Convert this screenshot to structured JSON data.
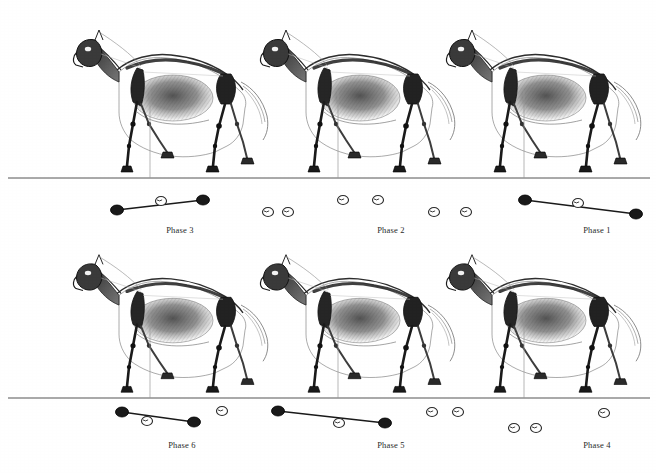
{
  "figure": {
    "width": 656,
    "height": 473,
    "background_color": "#ffffff",
    "ink_color": "#1a1a1a",
    "ground_line_color": "#555555"
  },
  "legend": {
    "filled_marker_meaning": "hoof in contact with ground",
    "open_marker_meaning": "hoof off the ground",
    "connector_meaning": "diagonal limb pair line"
  },
  "rows": [
    {
      "name": "top-row",
      "ground_y": 178,
      "ground_x1": 8,
      "ground_x2": 650,
      "phases": [
        {
          "id": "phase-3",
          "label": "Phase 3",
          "label_x": 180,
          "label_y": 225,
          "horse_x": 75,
          "horse_y": 20,
          "horse_w": 200,
          "horse_h": 160,
          "vertical_ref_x": 150,
          "connector": {
            "x1": 117,
            "y1": 210,
            "x2": 203,
            "y2": 200
          },
          "markers": [
            {
              "type": "filled",
              "cx": 117,
              "cy": 210,
              "rx": 6.5,
              "ry": 5
            },
            {
              "type": "open",
              "cx": 161,
              "cy": 201,
              "rx": 5.5,
              "ry": 4.5
            },
            {
              "type": "filled",
              "cx": 203,
              "cy": 200,
              "rx": 6.5,
              "ry": 5
            }
          ]
        },
        {
          "id": "phase-2",
          "label": "Phase 2",
          "label_x": 391,
          "label_y": 225,
          "horse_x": 262,
          "horse_y": 20,
          "horse_w": 200,
          "horse_h": 160,
          "vertical_ref_x": 338,
          "connector": null,
          "markers": [
            {
              "type": "open",
              "cx": 268,
              "cy": 212,
              "rx": 5.5,
              "ry": 4.5
            },
            {
              "type": "open",
              "cx": 288,
              "cy": 212,
              "rx": 5.5,
              "ry": 4.5
            },
            {
              "type": "open",
              "cx": 343,
              "cy": 200,
              "rx": 5.5,
              "ry": 4.5
            },
            {
              "type": "open",
              "cx": 378,
              "cy": 200,
              "rx": 5.5,
              "ry": 4.5
            },
            {
              "type": "open",
              "cx": 434,
              "cy": 212,
              "rx": 5.5,
              "ry": 4.5
            },
            {
              "type": "open",
              "cx": 466,
              "cy": 212,
              "rx": 5.5,
              "ry": 4.5
            }
          ]
        },
        {
          "id": "phase-1",
          "label": "Phase 1",
          "label_x": 597,
          "label_y": 225,
          "horse_x": 448,
          "horse_y": 20,
          "horse_w": 200,
          "horse_h": 160,
          "vertical_ref_x": 524,
          "connector": {
            "x1": 525,
            "y1": 200,
            "x2": 636,
            "y2": 214
          },
          "markers": [
            {
              "type": "filled",
              "cx": 525,
              "cy": 200,
              "rx": 6.5,
              "ry": 5
            },
            {
              "type": "open",
              "cx": 578,
              "cy": 203,
              "rx": 5.5,
              "ry": 4.5
            },
            {
              "type": "filled",
              "cx": 636,
              "cy": 214,
              "rx": 6.5,
              "ry": 5
            }
          ]
        }
      ]
    },
    {
      "name": "bottom-row",
      "ground_y": 398,
      "ground_x1": 8,
      "ground_x2": 650,
      "phases": [
        {
          "id": "phase-6",
          "label": "Phase 6",
          "label_x": 182,
          "label_y": 440,
          "horse_x": 75,
          "horse_y": 245,
          "horse_w": 200,
          "horse_h": 155,
          "vertical_ref_x": 150,
          "connector": {
            "x1": 122,
            "y1": 412,
            "x2": 194,
            "y2": 422
          },
          "markers": [
            {
              "type": "filled",
              "cx": 122,
              "cy": 412,
              "rx": 6.5,
              "ry": 5
            },
            {
              "type": "open",
              "cx": 147,
              "cy": 421,
              "rx": 5.5,
              "ry": 4.5
            },
            {
              "type": "filled",
              "cx": 194,
              "cy": 422,
              "rx": 6.5,
              "ry": 5
            },
            {
              "type": "open",
              "cx": 222,
              "cy": 411,
              "rx": 5.5,
              "ry": 4.5
            }
          ]
        },
        {
          "id": "phase-5",
          "label": "Phase 5",
          "label_x": 391,
          "label_y": 440,
          "horse_x": 262,
          "horse_y": 245,
          "horse_w": 200,
          "horse_h": 155,
          "vertical_ref_x": 338,
          "connector": {
            "x1": 278,
            "y1": 411,
            "x2": 385,
            "y2": 423
          },
          "markers": [
            {
              "type": "filled",
              "cx": 278,
              "cy": 411,
              "rx": 6.5,
              "ry": 5
            },
            {
              "type": "open",
              "cx": 339,
              "cy": 423,
              "rx": 5.5,
              "ry": 4.5
            },
            {
              "type": "filled",
              "cx": 385,
              "cy": 423,
              "rx": 6.5,
              "ry": 5
            },
            {
              "type": "open",
              "cx": 432,
              "cy": 412,
              "rx": 5.5,
              "ry": 4.5
            },
            {
              "type": "open",
              "cx": 458,
              "cy": 412,
              "rx": 5.5,
              "ry": 4.5
            }
          ]
        },
        {
          "id": "phase-4",
          "label": "Phase 4",
          "label_x": 597,
          "label_y": 440,
          "horse_x": 448,
          "horse_y": 245,
          "horse_w": 200,
          "horse_h": 155,
          "vertical_ref_x": 524,
          "connector": null,
          "markers": [
            {
              "type": "open",
              "cx": 514,
              "cy": 428,
              "rx": 5.5,
              "ry": 4.5
            },
            {
              "type": "open",
              "cx": 536,
              "cy": 428,
              "rx": 5.5,
              "ry": 4.5
            },
            {
              "type": "open",
              "cx": 604,
              "cy": 413,
              "rx": 5.5,
              "ry": 4.5
            }
          ]
        }
      ]
    }
  ]
}
